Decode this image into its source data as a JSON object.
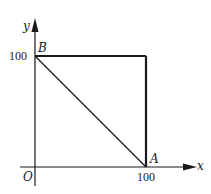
{
  "diagram": {
    "type": "coordinate-plane-geometry",
    "axes": {
      "x_label": "x",
      "y_label": "y",
      "origin_label": "O"
    },
    "ticks": {
      "x_tick": "100",
      "y_tick": "100"
    },
    "points": [
      {
        "name": "B",
        "label": "B",
        "coords": [
          0,
          100
        ]
      },
      {
        "name": "A",
        "label": "A",
        "coords": [
          100,
          0
        ]
      },
      {
        "name": "corner",
        "label": "",
        "coords": [
          100,
          100
        ]
      },
      {
        "name": "O",
        "label": "O",
        "coords": [
          0,
          0
        ]
      }
    ],
    "segments": [
      {
        "from": "B",
        "to": "corner",
        "style": "thick"
      },
      {
        "from": "corner",
        "to": "A",
        "style": "thick"
      },
      {
        "from": "B",
        "to": "A",
        "style": "thin"
      }
    ],
    "colors": {
      "ink": "#1a1a1a",
      "background": "#ffffff"
    }
  }
}
